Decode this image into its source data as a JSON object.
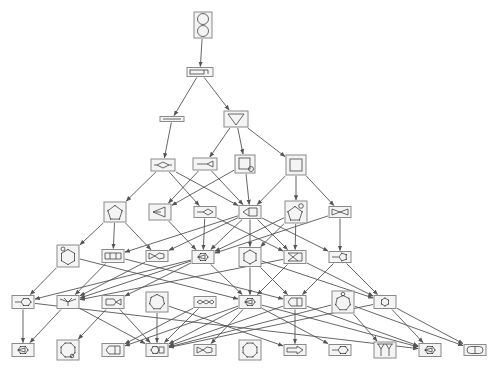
{
  "diagram": {
    "type": "directed-acyclic-graph",
    "colors": {
      "edge": "#555555",
      "box_stroke": "#8a8a8a",
      "box_fill": "#f4f4f4",
      "glyph": "#444444",
      "background": "#ffffff"
    },
    "nodes": [
      {
        "id": "n0",
        "x": 203,
        "y": 25,
        "w": 18,
        "h": 26,
        "glyph": "two-loops"
      },
      {
        "id": "n1",
        "x": 200,
        "y": 72,
        "w": 26,
        "h": 9,
        "glyph": "bar-with-loop"
      },
      {
        "id": "n2",
        "x": 172,
        "y": 119,
        "w": 24,
        "h": 5,
        "glyph": "line"
      },
      {
        "id": "n3",
        "x": 236,
        "y": 119,
        "w": 24,
        "h": 16,
        "glyph": "triangle-down"
      },
      {
        "id": "n4",
        "x": 163,
        "y": 165,
        "w": 24,
        "h": 12,
        "glyph": "diamond-tails"
      },
      {
        "id": "n5",
        "x": 205,
        "y": 164,
        "w": 24,
        "h": 12,
        "glyph": "fork"
      },
      {
        "id": "n6",
        "x": 245,
        "y": 164,
        "w": 20,
        "h": 18,
        "glyph": "square-loop"
      },
      {
        "id": "n7",
        "x": 296,
        "y": 165,
        "w": 20,
        "h": 20,
        "glyph": "square"
      },
      {
        "id": "n8",
        "x": 115,
        "y": 212,
        "w": 22,
        "h": 20,
        "glyph": "pentagon"
      },
      {
        "id": "n9",
        "x": 160,
        "y": 212,
        "w": 22,
        "h": 16,
        "glyph": "arrow-triangle"
      },
      {
        "id": "n10",
        "x": 205,
        "y": 212,
        "w": 22,
        "h": 11,
        "glyph": "line-diamond"
      },
      {
        "id": "n11",
        "x": 250,
        "y": 212,
        "w": 22,
        "h": 13,
        "glyph": "triangle-square"
      },
      {
        "id": "n12",
        "x": 296,
        "y": 212,
        "w": 22,
        "h": 22,
        "glyph": "pentagon-loop"
      },
      {
        "id": "n13",
        "x": 340,
        "y": 212,
        "w": 22,
        "h": 11,
        "glyph": "bowtie"
      },
      {
        "id": "n14",
        "x": 68,
        "y": 256,
        "w": 22,
        "h": 22,
        "glyph": "hexagon-loop"
      },
      {
        "id": "n15",
        "x": 113,
        "y": 256,
        "w": 22,
        "h": 13,
        "glyph": "ladder"
      },
      {
        "id": "n16",
        "x": 157,
        "y": 256,
        "w": 22,
        "h": 11,
        "glyph": "fish"
      },
      {
        "id": "n17",
        "x": 203,
        "y": 257,
        "w": 22,
        "h": 13,
        "glyph": "hexagon-tri"
      },
      {
        "id": "n18",
        "x": 250,
        "y": 257,
        "w": 22,
        "h": 19,
        "glyph": "hexagon"
      },
      {
        "id": "n19",
        "x": 295,
        "y": 257,
        "w": 22,
        "h": 13,
        "glyph": "crossed-square"
      },
      {
        "id": "n20",
        "x": 340,
        "y": 257,
        "w": 22,
        "h": 11,
        "glyph": "line-pentagon"
      },
      {
        "id": "n21",
        "x": 23,
        "y": 302,
        "w": 22,
        "h": 13,
        "glyph": "line-hexagon"
      },
      {
        "id": "n22",
        "x": 68,
        "y": 302,
        "w": 22,
        "h": 13,
        "glyph": "bird"
      },
      {
        "id": "n23",
        "x": 113,
        "y": 302,
        "w": 22,
        "h": 13,
        "glyph": "fish-tail"
      },
      {
        "id": "n24",
        "x": 157,
        "y": 302,
        "w": 22,
        "h": 20,
        "glyph": "heptagon"
      },
      {
        "id": "n25",
        "x": 205,
        "y": 302,
        "w": 22,
        "h": 11,
        "glyph": "chain"
      },
      {
        "id": "n26",
        "x": 250,
        "y": 302,
        "w": 22,
        "h": 13,
        "glyph": "hexagon-tri"
      },
      {
        "id": "n27",
        "x": 295,
        "y": 302,
        "w": 22,
        "h": 13,
        "glyph": "house-square"
      },
      {
        "id": "n28",
        "x": 343,
        "y": 302,
        "w": 22,
        "h": 22,
        "glyph": "heptagon-loop"
      },
      {
        "id": "n29",
        "x": 385,
        "y": 302,
        "w": 22,
        "h": 13,
        "glyph": "hexagon"
      },
      {
        "id": "n30",
        "x": 23,
        "y": 350,
        "w": 22,
        "h": 13,
        "glyph": "hexagon-tri"
      },
      {
        "id": "n31",
        "x": 68,
        "y": 350,
        "w": 22,
        "h": 20,
        "glyph": "octagon-loop"
      },
      {
        "id": "n32",
        "x": 113,
        "y": 350,
        "w": 22,
        "h": 13,
        "glyph": "house-square"
      },
      {
        "id": "n33",
        "x": 157,
        "y": 350,
        "w": 22,
        "h": 13,
        "glyph": "hexagon-square"
      },
      {
        "id": "n34",
        "x": 205,
        "y": 350,
        "w": 22,
        "h": 11,
        "glyph": "fish"
      },
      {
        "id": "n35",
        "x": 250,
        "y": 350,
        "w": 22,
        "h": 20,
        "glyph": "octagon"
      },
      {
        "id": "n36",
        "x": 295,
        "y": 350,
        "w": 22,
        "h": 11,
        "glyph": "arrow-box"
      },
      {
        "id": "n37",
        "x": 340,
        "y": 350,
        "w": 22,
        "h": 11,
        "glyph": "line-hexagon"
      },
      {
        "id": "n38",
        "x": 385,
        "y": 350,
        "w": 22,
        "h": 16,
        "glyph": "y-shapes"
      },
      {
        "id": "n39",
        "x": 430,
        "y": 350,
        "w": 22,
        "h": 13,
        "glyph": "hexagon-tri"
      },
      {
        "id": "n40",
        "x": 475,
        "y": 350,
        "w": 22,
        "h": 11,
        "glyph": "capsule"
      }
    ],
    "edges": [
      [
        "n0",
        "n1"
      ],
      [
        "n1",
        "n2"
      ],
      [
        "n1",
        "n3"
      ],
      [
        "n2",
        "n4"
      ],
      [
        "n3",
        "n5"
      ],
      [
        "n3",
        "n6"
      ],
      [
        "n3",
        "n7"
      ],
      [
        "n4",
        "n8"
      ],
      [
        "n4",
        "n10"
      ],
      [
        "n4",
        "n11"
      ],
      [
        "n5",
        "n9"
      ],
      [
        "n5",
        "n11"
      ],
      [
        "n6",
        "n9"
      ],
      [
        "n6",
        "n11"
      ],
      [
        "n7",
        "n11"
      ],
      [
        "n7",
        "n12"
      ],
      [
        "n7",
        "n13"
      ],
      [
        "n8",
        "n14"
      ],
      [
        "n8",
        "n15"
      ],
      [
        "n8",
        "n16"
      ],
      [
        "n9",
        "n17"
      ],
      [
        "n10",
        "n17"
      ],
      [
        "n10",
        "n19"
      ],
      [
        "n11",
        "n15"
      ],
      [
        "n11",
        "n16"
      ],
      [
        "n11",
        "n17"
      ],
      [
        "n11",
        "n18"
      ],
      [
        "n11",
        "n19"
      ],
      [
        "n11",
        "n20"
      ],
      [
        "n12",
        "n17"
      ],
      [
        "n12",
        "n18"
      ],
      [
        "n12",
        "n19"
      ],
      [
        "n13",
        "n20"
      ],
      [
        "n13",
        "n17"
      ],
      [
        "n14",
        "n21"
      ],
      [
        "n14",
        "n26"
      ],
      [
        "n15",
        "n22"
      ],
      [
        "n15",
        "n27"
      ],
      [
        "n16",
        "n22"
      ],
      [
        "n17",
        "n21"
      ],
      [
        "n17",
        "n22"
      ],
      [
        "n17",
        "n23"
      ],
      [
        "n17",
        "n26"
      ],
      [
        "n18",
        "n26"
      ],
      [
        "n18",
        "n27"
      ],
      [
        "n18",
        "n29"
      ],
      [
        "n19",
        "n22"
      ],
      [
        "n19",
        "n26"
      ],
      [
        "n19",
        "n29"
      ],
      [
        "n20",
        "n27"
      ],
      [
        "n20",
        "n29"
      ],
      [
        "n21",
        "n30"
      ],
      [
        "n21",
        "n39"
      ],
      [
        "n22",
        "n33"
      ],
      [
        "n22",
        "n30"
      ],
      [
        "n23",
        "n33"
      ],
      [
        "n23",
        "n31"
      ],
      [
        "n24",
        "n33"
      ],
      [
        "n24",
        "n36"
      ],
      [
        "n25",
        "n33"
      ],
      [
        "n25",
        "n32"
      ],
      [
        "n26",
        "n32"
      ],
      [
        "n26",
        "n33"
      ],
      [
        "n26",
        "n34"
      ],
      [
        "n26",
        "n37"
      ],
      [
        "n26",
        "n39"
      ],
      [
        "n27",
        "n33"
      ],
      [
        "n27",
        "n36"
      ],
      [
        "n27",
        "n39"
      ],
      [
        "n28",
        "n33"
      ],
      [
        "n28",
        "n40"
      ],
      [
        "n28",
        "n38"
      ],
      [
        "n29",
        "n39"
      ],
      [
        "n29",
        "n40"
      ],
      [
        "n29",
        "n33"
      ]
    ]
  }
}
